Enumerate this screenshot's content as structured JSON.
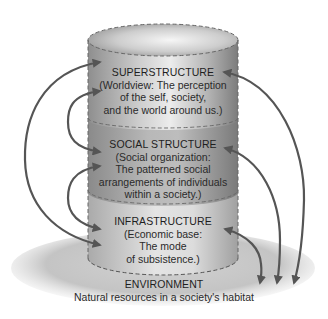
{
  "diagram": {
    "layers": [
      {
        "title": "SUPERSTRUCTURE",
        "lines": [
          "(Worldview: The perception",
          "of the self, society,",
          "and the world around us.)"
        ]
      },
      {
        "title": "SOCIAL STRUCTURE",
        "lines": [
          "(Social organization:",
          "The patterned social",
          "arrangements of individuals",
          "within a society.)"
        ]
      },
      {
        "title": "INFRASTRUCTURE",
        "lines": [
          "(Economic base:",
          "The mode",
          "of subsistence.)"
        ]
      }
    ],
    "environment": {
      "title": "ENVIRONMENT",
      "subtitle": "Natural resources in a society's habitat"
    },
    "colors": {
      "arrow": "#555555",
      "cylinder_dark": "#8a8a8a",
      "cylinder_light": "#e8e8e8",
      "environment": "#c8c8c8",
      "dash": "#666666"
    },
    "connections": [
      {
        "from": "superstructure",
        "to": "infrastructure",
        "type": "bidirectional",
        "side": "left"
      },
      {
        "from": "superstructure",
        "to": "social-structure",
        "type": "bidirectional",
        "side": "left"
      },
      {
        "from": "social-structure",
        "to": "infrastructure",
        "type": "bidirectional",
        "side": "left"
      },
      {
        "from": "environment",
        "to": "superstructure",
        "type": "bidirectional",
        "side": "right"
      },
      {
        "from": "environment",
        "to": "social-structure",
        "type": "bidirectional",
        "side": "right"
      },
      {
        "from": "environment",
        "to": "infrastructure",
        "type": "bidirectional",
        "side": "right"
      }
    ]
  }
}
